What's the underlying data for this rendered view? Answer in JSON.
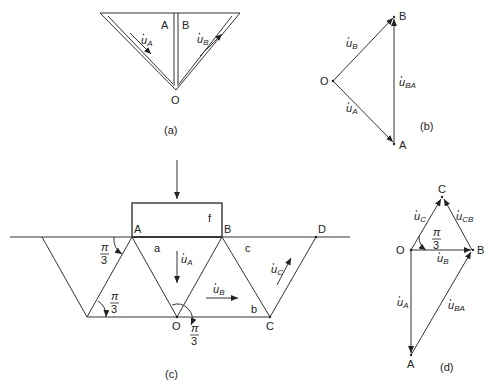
{
  "panels": {
    "a": {
      "caption": "(a)",
      "points": {
        "A": "A",
        "B": "B",
        "O": "O"
      },
      "velocities": {
        "uA": "u",
        "uA_sub": "A",
        "uB": "u",
        "uB_sub": "B"
      }
    },
    "b": {
      "caption": "(b)",
      "points": {
        "O": "O",
        "A": "A",
        "B": "B"
      },
      "vectors": {
        "uB": "u",
        "uB_sub": "B",
        "uA": "u",
        "uA_sub": "A",
        "uBA": "u",
        "uBA_sub": "BA"
      }
    },
    "c": {
      "caption": "(c)",
      "points": {
        "A": "A",
        "B": "B",
        "D": "D",
        "O": "O",
        "C": "C"
      },
      "regions": {
        "f": "f",
        "a": "a",
        "b": "b",
        "c": "c"
      },
      "angles": {
        "num": "π",
        "den": "3"
      },
      "velocities": {
        "uA": "u",
        "uA_sub": "A",
        "uB": "u",
        "uB_sub": "B",
        "uC": "u",
        "uC_sub": "C"
      }
    },
    "d": {
      "caption": "(d)",
      "points": {
        "O": "O",
        "A": "A",
        "B": "B",
        "C": "C"
      },
      "angle": {
        "num": "π",
        "den": "3"
      },
      "vectors": {
        "uC": "u",
        "uC_sub": "C",
        "uCB": "u",
        "uCB_sub": "CB",
        "uB": "u",
        "uB_sub": "B",
        "uA": "u",
        "uA_sub": "A",
        "uBA": "u",
        "uBA_sub": "BA"
      }
    }
  },
  "colors": {
    "line": "#333333",
    "background": "#ffffff"
  }
}
